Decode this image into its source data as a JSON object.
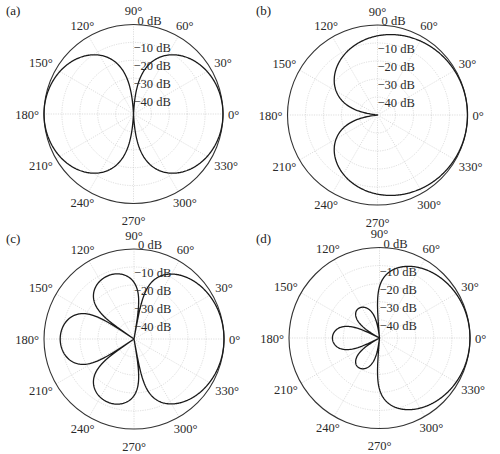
{
  "figure": {
    "panels": [
      "(a)",
      "(b)",
      "(c)",
      "(d)"
    ]
  },
  "chart_data": [
    {
      "type": "polar",
      "panel": "(a)",
      "title": "",
      "description": "Dipole (figure-eight) pattern, maxima at 0° and 180°, nulls at 90° and 270°",
      "angle_ticks": [
        "0°",
        "30°",
        "60°",
        "90°",
        "120°",
        "150°",
        "180°",
        "210°",
        "240°",
        "270°",
        "300°",
        "330°"
      ],
      "radial_ticks": [
        "0 dB",
        "−10 dB",
        "−20 dB",
        "−30 dB",
        "−40 dB"
      ],
      "rlim_db": [
        -50,
        0
      ],
      "grid": true,
      "pattern": "dipole",
      "samples_deg": [
        0,
        30,
        60,
        80,
        90,
        100,
        120,
        150,
        180,
        210,
        240,
        270,
        300,
        330
      ],
      "samples_db": [
        0,
        -1.2,
        -6,
        -15,
        -50,
        -15,
        -6,
        -1.2,
        0,
        -1.2,
        -6,
        -50,
        -6,
        -1.2
      ]
    },
    {
      "type": "polar",
      "panel": "(b)",
      "title": "",
      "description": "Cardioid pattern, maximum at 0°, null at 180°",
      "angle_ticks": [
        "0°",
        "30°",
        "60°",
        "90°",
        "120°",
        "150°",
        "180°",
        "210°",
        "240°",
        "270°",
        "300°",
        "330°"
      ],
      "radial_ticks": [
        "0 dB",
        "−10 dB",
        "−20 dB",
        "−30 dB",
        "−40 dB"
      ],
      "rlim_db": [
        -50,
        0
      ],
      "grid": true,
      "pattern": "cardioid",
      "samples_deg": [
        0,
        30,
        60,
        90,
        120,
        150,
        170,
        180,
        190,
        210,
        240,
        270,
        300,
        330
      ],
      "samples_db": [
        0,
        -0.3,
        -1.2,
        -3,
        -6,
        -11.4,
        -18,
        -50,
        -18,
        -11.4,
        -6,
        -3,
        -1.2,
        -0.3
      ]
    },
    {
      "type": "polar",
      "panel": "(c)",
      "title": "",
      "description": "Main lobe at 0° with three side lobes near 110°, 180°, 250°",
      "angle_ticks": [
        "0°",
        "30°",
        "60°",
        "90°",
        "120°",
        "150°",
        "180°",
        "210°",
        "240°",
        "270°",
        "300°",
        "330°"
      ],
      "radial_ticks": [
        "0 dB",
        "−10 dB",
        "−20 dB",
        "−30 dB",
        "−40 dB"
      ],
      "rlim_db": [
        -50,
        0
      ],
      "grid": true,
      "pattern": "multilobe",
      "lobes": [
        {
          "center_deg": 0,
          "peak_db": 0,
          "null_left_deg": 80,
          "null_right_deg": -80
        },
        {
          "center_deg": 112,
          "peak_db": -12,
          "null_left_deg": 146,
          "null_right_deg": 80
        },
        {
          "center_deg": 180,
          "peak_db": -9,
          "null_left_deg": 214,
          "null_right_deg": 146
        },
        {
          "center_deg": 248,
          "peak_db": -12,
          "null_left_deg": 280,
          "null_right_deg": 214
        }
      ]
    },
    {
      "type": "polar",
      "panel": "(d)",
      "title": "",
      "description": "Main lobe at 0° with small back lobes near 125°, 180°, 235°",
      "angle_ticks": [
        "0°",
        "30°",
        "60°",
        "90°",
        "120°",
        "150°",
        "180°",
        "210°",
        "240°",
        "270°",
        "300°",
        "330°"
      ],
      "radial_ticks": [
        "0 dB",
        "−10 dB",
        "−20 dB",
        "−30 dB",
        "−40 dB"
      ],
      "rlim_db": [
        -50,
        0
      ],
      "grid": true,
      "pattern": "multilobe",
      "lobes": [
        {
          "center_deg": 0,
          "peak_db": 0,
          "null_left_deg": 95,
          "null_right_deg": -95
        },
        {
          "center_deg": 126,
          "peak_db": -30,
          "null_left_deg": 152,
          "null_right_deg": 95
        },
        {
          "center_deg": 180,
          "peak_db": -24,
          "null_left_deg": 208,
          "null_right_deg": 152
        },
        {
          "center_deg": 234,
          "peak_db": -30,
          "null_left_deg": 265,
          "null_right_deg": 208
        }
      ]
    }
  ]
}
